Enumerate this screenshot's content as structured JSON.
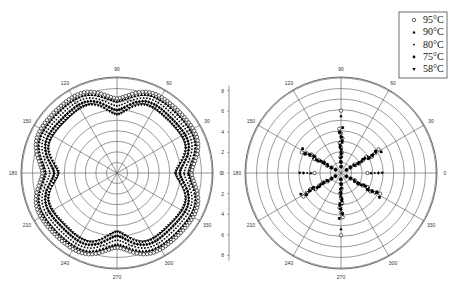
{
  "chart_data": {
    "type": "polar-scatter",
    "legend": {
      "position": "top-right",
      "entries": [
        {
          "label": "95°C",
          "marker": "open-circle"
        },
        {
          "label": "90°C",
          "marker": "triangle-up"
        },
        {
          "label": "80°C",
          "marker": "small-dot"
        },
        {
          "label": "75°C",
          "marker": "diamond"
        },
        {
          "label": "58°C",
          "marker": "triangle-down"
        }
      ]
    },
    "angle_ticks": [
      0,
      30,
      60,
      90,
      120,
      150,
      180,
      210,
      240,
      270,
      300,
      330
    ],
    "radial_axis": {
      "ticks_up": [
        "8",
        "6",
        "4",
        "2",
        "0"
      ],
      "ticks_down": [
        "2",
        "4",
        "6",
        "8"
      ],
      "range": [
        0,
        9
      ],
      "rings": 9
    },
    "plots": [
      {
        "name": "left",
        "pattern": "four-lobed rosette (peaks near 30,150,210,330; dips at 0,90,180,270)",
        "series": [
          {
            "name": "95°C",
            "base": 8.0,
            "amp": 0.9
          },
          {
            "name": "90°C",
            "base": 7.7,
            "amp": 0.9
          },
          {
            "name": "80°C",
            "base": 7.4,
            "amp": 1.0
          },
          {
            "name": "75°C",
            "base": 7.1,
            "amp": 1.1
          },
          {
            "name": "58°C",
            "base": 6.8,
            "amp": 1.2
          }
        ]
      },
      {
        "name": "right",
        "pattern": "six-fold star with radial spokes at 30,90,150,210,270,330 and points along 0/180",
        "series": [
          {
            "name": "95°C",
            "rmax": 4.2
          },
          {
            "name": "90°C",
            "rmax": 5.4
          },
          {
            "name": "80°C",
            "rmax": 3.8
          },
          {
            "name": "75°C",
            "rmax": 3.9
          },
          {
            "name": "58°C",
            "rmax": 5.8
          }
        ]
      }
    ]
  }
}
